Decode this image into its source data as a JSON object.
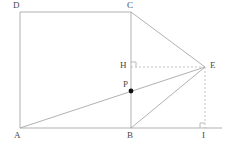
{
  "figure": {
    "type": "geometry-diagram",
    "background_color": "#ffffff",
    "line_color": "#b3b3b3",
    "solid_line_color": "#a8a8a8",
    "dashed_line_color": "#bcbcbc",
    "point_color": "#111111",
    "label_color": "#4a4a4a",
    "width": 226,
    "height": 150
  },
  "labels": {
    "a": "A",
    "b": "B",
    "c": "C",
    "d": "D",
    "e": "E",
    "h": "H",
    "i": "I",
    "p": "P"
  },
  "points": {
    "A": {
      "x": 20,
      "y": 128,
      "label": "A",
      "label_x": 14,
      "label_y": 131,
      "marked": false
    },
    "B": {
      "x": 131,
      "y": 128,
      "label": "B",
      "label_x": 127,
      "label_y": 131,
      "marked": false
    },
    "C": {
      "x": 131,
      "y": 12,
      "label": "C",
      "label_x": 127,
      "label_y": 1,
      "marked": false
    },
    "D": {
      "x": 20,
      "y": 12,
      "label": "D",
      "label_x": 13,
      "label_y": 1,
      "marked": false
    },
    "E": {
      "x": 205,
      "y": 67,
      "label": "E",
      "label_x": 210,
      "label_y": 61,
      "marked": false
    },
    "H": {
      "x": 131,
      "y": 67,
      "label": "H",
      "label_x": 120,
      "label_y": 61,
      "marked": false
    },
    "I": {
      "x": 205,
      "y": 128,
      "label": "I",
      "label_x": 202,
      "label_y": 131,
      "marked": false
    },
    "P": {
      "x": 131,
      "y": 91,
      "label": "P",
      "label_x": 123,
      "label_y": 80,
      "marked": true
    }
  },
  "segments": [
    {
      "name": "side-DA",
      "from": "D",
      "to": "A",
      "style": "solid"
    },
    {
      "name": "side-DC",
      "from": "D",
      "to": "C",
      "style": "solid"
    },
    {
      "name": "side-CB",
      "from": "C",
      "to": "B",
      "style": "solid"
    },
    {
      "name": "baseline-AI",
      "from": "A",
      "to": "I",
      "style": "solid"
    },
    {
      "name": "segment-CE",
      "from": "C",
      "to": "E",
      "style": "solid"
    },
    {
      "name": "segment-AE",
      "from": "A",
      "to": "E",
      "style": "solid"
    },
    {
      "name": "segment-BE",
      "from": "B",
      "to": "E",
      "style": "solid"
    },
    {
      "name": "segment-HE",
      "from": "H",
      "to": "E",
      "style": "dashed"
    },
    {
      "name": "segment-EI",
      "from": "E",
      "to": "I",
      "style": "dashed"
    }
  ],
  "baseline_extension": {
    "name": "baseline-extension",
    "from_x": 205,
    "to_x": 222,
    "y": 128
  },
  "right_angles": [
    {
      "name": "right-angle-at-H",
      "x": 131,
      "y": 67,
      "dir_x": 1,
      "dir_y": -1,
      "size": 5
    },
    {
      "name": "right-angle-at-I",
      "x": 205,
      "y": 128,
      "dir_x": -1,
      "dir_y": -1,
      "size": 5
    }
  ]
}
